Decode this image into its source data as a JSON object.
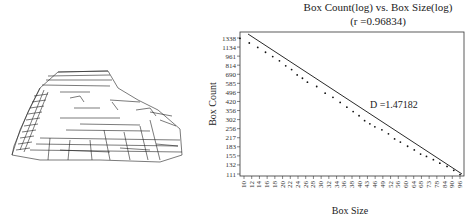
{
  "figure": {
    "left_panel": "line-drawing of stepped rock pyramid (fracture/edge sketch)",
    "right_panel": "box-counting log-log plot"
  },
  "chart_data": {
    "type": "scatter",
    "title": "Box Count(log) vs. Box Size(log)",
    "subtitle": "(r =0.96834)",
    "xlabel": "Box Size",
    "ylabel": "Box Count",
    "annotation": "D =1.47182",
    "fit_line": true,
    "x_scale": "log",
    "y_scale": "log",
    "x_ticks": [
      "10",
      "12",
      "14",
      "16",
      "18",
      "20",
      "22",
      "24",
      "26",
      "28",
      "30",
      "32",
      "34",
      "36",
      "38",
      "40",
      "43",
      "46",
      "49",
      "52",
      "56",
      "60",
      "64",
      "68",
      "73",
      "78",
      "84",
      "90",
      "96"
    ],
    "y_ticks": [
      "1338",
      "1134",
      "961",
      "814",
      "690",
      "585",
      "496",
      "420",
      "356",
      "302",
      "256",
      "217",
      "183",
      "155",
      "132",
      "111"
    ],
    "xlim": [
      10,
      100
    ],
    "ylim": [
      111,
      1500
    ],
    "fractal_dimension": 1.47182,
    "r": 0.96834,
    "points": [
      [
        10,
        1338
      ],
      [
        11,
        1230
      ],
      [
        12,
        1134
      ],
      [
        13,
        1040
      ],
      [
        14,
        961
      ],
      [
        15,
        890
      ],
      [
        16,
        814
      ],
      [
        17,
        760
      ],
      [
        18,
        690
      ],
      [
        19,
        650
      ],
      [
        20,
        605
      ],
      [
        22,
        560
      ],
      [
        24,
        496
      ],
      [
        26,
        460
      ],
      [
        28,
        420
      ],
      [
        30,
        385
      ],
      [
        32,
        356
      ],
      [
        34,
        330
      ],
      [
        36,
        302
      ],
      [
        38,
        285
      ],
      [
        40,
        270
      ],
      [
        43,
        256
      ],
      [
        46,
        238
      ],
      [
        49,
        217
      ],
      [
        52,
        205
      ],
      [
        56,
        190
      ],
      [
        60,
        178
      ],
      [
        64,
        165
      ],
      [
        68,
        158
      ],
      [
        73,
        149
      ],
      [
        78,
        140
      ],
      [
        84,
        132
      ],
      [
        90,
        123
      ],
      [
        96,
        114
      ]
    ]
  }
}
